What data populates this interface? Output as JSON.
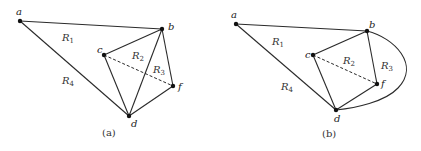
{
  "panels": [
    {
      "id": "a",
      "caption": "(a)",
      "caption_pos": [
        102,
        136
      ],
      "vertices": [
        {
          "name": "a",
          "x": 20,
          "y": 21,
          "lx": 16,
          "ly": 15
        },
        {
          "name": "b",
          "x": 162,
          "y": 29,
          "lx": 168,
          "ly": 30
        },
        {
          "name": "c",
          "x": 104,
          "y": 55,
          "lx": 97,
          "ly": 53
        },
        {
          "name": "f",
          "x": 173,
          "y": 86,
          "lx": 178,
          "ly": 90
        },
        {
          "name": "d",
          "x": 129,
          "y": 116,
          "lx": 131,
          "ly": 127
        }
      ],
      "edges": [
        {
          "from": "a",
          "to": "b",
          "style": "solid"
        },
        {
          "from": "a",
          "to": "d",
          "style": "solid"
        },
        {
          "from": "b",
          "to": "c",
          "style": "solid"
        },
        {
          "from": "b",
          "to": "d",
          "style": "solid"
        },
        {
          "from": "b",
          "to": "f",
          "style": "solid"
        },
        {
          "from": "c",
          "to": "d",
          "style": "solid"
        },
        {
          "from": "d",
          "to": "f",
          "style": "solid"
        },
        {
          "from": "c",
          "to": "f",
          "style": "dashed"
        }
      ],
      "regions": [
        {
          "label": "R",
          "sub": "1",
          "x": 62,
          "y": 41
        },
        {
          "label": "R",
          "sub": "2",
          "x": 132,
          "y": 59
        },
        {
          "label": "R",
          "sub": "3",
          "x": 153,
          "y": 73
        },
        {
          "label": "R",
          "sub": "4",
          "x": 62,
          "y": 84
        }
      ]
    },
    {
      "id": "b",
      "caption": "(b)",
      "caption_pos": [
        322,
        137
      ],
      "vertices": [
        {
          "name": "a",
          "x": 236,
          "y": 24,
          "lx": 231,
          "ly": 18
        },
        {
          "name": "b",
          "x": 367,
          "y": 31,
          "lx": 369,
          "ly": 28
        },
        {
          "name": "c",
          "x": 313,
          "y": 55,
          "lx": 305,
          "ly": 58
        },
        {
          "name": "f",
          "x": 377,
          "y": 84,
          "lx": 381,
          "ly": 87
        },
        {
          "name": "d",
          "x": 336,
          "y": 110,
          "lx": 334,
          "ly": 122
        }
      ],
      "edges": [
        {
          "from": "a",
          "to": "b",
          "style": "solid"
        },
        {
          "from": "a",
          "to": "d",
          "style": "solid"
        },
        {
          "from": "b",
          "to": "c",
          "style": "solid"
        },
        {
          "from": "b",
          "to": "f",
          "style": "solid"
        },
        {
          "from": "c",
          "to": "d",
          "style": "solid"
        },
        {
          "from": "d",
          "to": "f",
          "style": "solid"
        },
        {
          "from": "c",
          "to": "f",
          "style": "dashed"
        }
      ],
      "curved_edges": [
        {
          "from": "b",
          "to": "d",
          "path": "M367,31 C395,38 420,65 398,88 C385,102 355,108 336,110"
        }
      ],
      "regions": [
        {
          "label": "R",
          "sub": "1",
          "x": 272,
          "y": 45
        },
        {
          "label": "R",
          "sub": "2",
          "x": 343,
          "y": 64
        },
        {
          "label": "R",
          "sub": "3",
          "x": 381,
          "y": 69
        },
        {
          "label": "R",
          "sub": "4",
          "x": 281,
          "y": 90
        }
      ]
    }
  ]
}
